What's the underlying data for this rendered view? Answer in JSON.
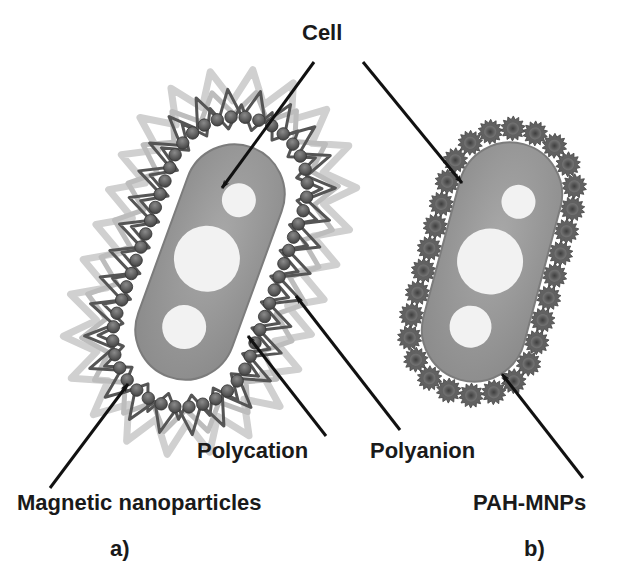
{
  "figure": {
    "colors": {
      "background": "#ffffff",
      "text": "#1a1a1a",
      "cell_fill": "#9a9a9a",
      "cell_edge": "#7c7c7c",
      "vacuole": "#f2f2f2",
      "nanoparticle": "#5a5a5a",
      "polycation": "#555555",
      "polyanion": "#d0d0d0",
      "pah_mnp": "#616161",
      "arrow": "#111111"
    },
    "labels": {
      "cell": "Cell",
      "polycation": "Polycation",
      "polyanion": "Polyanion",
      "magnetic_nanoparticles": "Magnetic nanoparticles",
      "pah_mnps": "PAH-MNPs",
      "panel_a": "a)",
      "panel_b": "b)"
    },
    "panels": [
      {
        "id": "a",
        "caption": "a)",
        "description": "Cell coated with alternating polycation / polyanion layers embedding magnetic nanoparticles",
        "layers": [
          "Cell",
          "Magnetic nanoparticles",
          "Polycation",
          "Polyanion"
        ]
      },
      {
        "id": "b",
        "caption": "b)",
        "description": "Cell coated directly with PAH-MNPs",
        "layers": [
          "Cell",
          "PAH-MNPs"
        ]
      }
    ]
  }
}
